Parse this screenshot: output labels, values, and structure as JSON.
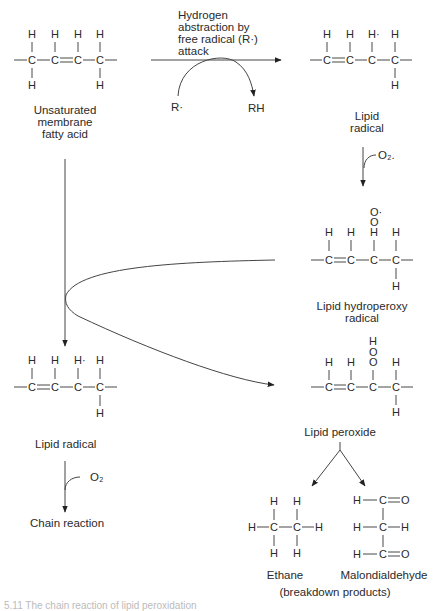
{
  "diagram": {
    "type": "reaction-pathway",
    "topic": "lipid peroxidation chain reaction",
    "nodes": {
      "unsaturated_fatty_acid": {
        "label_lines": [
          "Unsaturated",
          "membrane",
          "fatty acid"
        ]
      },
      "lipid_radical_top": {
        "label_lines": [
          "Lipid",
          "radical"
        ]
      },
      "lipid_hydroperoxy_radical": {
        "label_lines": [
          "Lipid hydroperoxy",
          "radical"
        ]
      },
      "lipid_radical_left": {
        "label": "Lipid radical"
      },
      "lipid_peroxide": {
        "label": "Lipid peroxide"
      },
      "chain_reaction": {
        "label": "Chain reaction"
      },
      "ethane": {
        "label": "Ethane"
      },
      "malondialdehyde": {
        "label": "Malondialdehyde"
      },
      "breakdown_products": {
        "label": "(breakdown products)"
      }
    },
    "top_arrow": {
      "label_lines": [
        "Hydrogen",
        "abstraction by",
        "free radical (R·)",
        "attack"
      ],
      "reactant": "R·",
      "product": "RH"
    },
    "oxygen_step_right": {
      "label": "O₂."
    },
    "oxygen_step_left": {
      "label": "O₂"
    },
    "atoms": {
      "H": "H",
      "C": "C",
      "O": "O",
      "H_radical": "H·",
      "O_radical": "O·"
    }
  },
  "caption": "5.11  The chain reaction of lipid peroxidation"
}
